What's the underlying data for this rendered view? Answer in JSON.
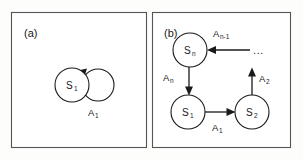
{
  "figure": {
    "background_color": "#fdfdfc",
    "stroke_color": "#1a1a1a",
    "frame_color": "#555555",
    "panels": [
      {
        "tag": "(a)",
        "id": "panel-a",
        "nodes": [
          {
            "id": "a-s1",
            "base": "S",
            "sub": "1",
            "cx": 72,
            "cy": 85,
            "r": 17
          }
        ],
        "self_loops": [
          {
            "on": "a-s1",
            "label_base": "A",
            "label_sub": "1",
            "cx": 98,
            "cy": 85,
            "r": 16
          }
        ],
        "edges": []
      },
      {
        "tag": "(b)",
        "id": "panel-b",
        "nodes": [
          {
            "id": "b-sn",
            "base": "S",
            "sub": "n",
            "cx": 190,
            "cy": 50,
            "r": 17
          },
          {
            "id": "b-s1",
            "base": "S",
            "sub": "1",
            "cx": 188,
            "cy": 112,
            "r": 17
          },
          {
            "id": "b-s2",
            "base": "S",
            "sub": "2",
            "cx": 252,
            "cy": 112,
            "r": 17
          }
        ],
        "self_loops": [],
        "edges": [
          {
            "id": "edge-an-1",
            "from": "(incoming)",
            "to": "b-sn",
            "label_base": "A",
            "label_sub": "n-1",
            "direction": "left"
          },
          {
            "id": "edge-an",
            "from": "b-sn",
            "to": "b-s1",
            "label_base": "A",
            "label_sub": "n",
            "direction": "down"
          },
          {
            "id": "edge-a1",
            "from": "b-s1",
            "to": "b-s2",
            "label_base": "A",
            "label_sub": "1",
            "direction": "right"
          },
          {
            "id": "edge-a2",
            "from": "b-s2",
            "to": "(outgoing)",
            "label_base": "A",
            "label_sub": "2",
            "direction": "up"
          }
        ],
        "ellipsis": "..."
      }
    ]
  },
  "labels": {
    "panel_a_tag": "(a)",
    "panel_b_tag": "(b)",
    "a_state_1_base": "S",
    "a_state_1_sub": "1",
    "a_action_1_base": "A",
    "a_action_1_sub": "1",
    "b_state_n_base": "S",
    "b_state_n_sub": "n",
    "b_state_1_base": "S",
    "b_state_1_sub": "1",
    "b_state_2_base": "S",
    "b_state_2_sub": "2",
    "b_action_nminus1_base": "A",
    "b_action_nminus1_sub": "n-1",
    "b_action_n_base": "A",
    "b_action_n_sub": "n",
    "b_action_1_base": "A",
    "b_action_1_sub": "1",
    "b_action_2_base": "A",
    "b_action_2_sub": "2",
    "b_ellipsis": "..."
  }
}
